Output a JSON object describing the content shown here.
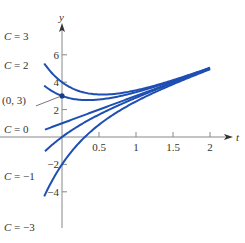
{
  "chart_data": {
    "type": "line",
    "title": "",
    "xlabel": "t",
    "ylabel": "y",
    "formula": "y = 2t + 1 + C e^(-2t)",
    "xlim": [
      -0.35,
      2.25
    ],
    "ylim": [
      -6.5,
      8.2
    ],
    "x_ticks": [
      0.5,
      1,
      1.5,
      2
    ],
    "x_tick_labels": [
      "0.5",
      "1",
      "1.5",
      "2"
    ],
    "y_ticks": [
      -4,
      -2,
      2,
      4,
      6
    ],
    "y_tick_labels": [
      "-4",
      "-2",
      "2",
      "4",
      "6"
    ],
    "grid": false,
    "color": "#1f4fb3",
    "series": [
      {
        "name": "C = 3",
        "C": 3,
        "t_start": -0.24
      },
      {
        "name": "C = 2",
        "C": 2,
        "t_start": -0.24
      },
      {
        "name": "C = 0",
        "C": 0,
        "t_start": -0.23
      },
      {
        "name": "C = -1",
        "C": -1,
        "t_start": -0.23
      },
      {
        "name": "C = -3",
        "C": -3,
        "t_start": -0.24
      }
    ],
    "t_end": 2,
    "annotations": [
      {
        "text": "(0, 3)",
        "x": 0,
        "y": 3
      }
    ],
    "curve_labels": [
      {
        "text": "C = 3",
        "px": 4,
        "py": 40
      },
      {
        "text": "C = 2",
        "px": 4,
        "py": 69
      },
      {
        "text": "(0, 3)",
        "px": 2,
        "py": 104
      },
      {
        "text": "C = 0",
        "px": 4,
        "py": 133
      },
      {
        "text": "C = −1",
        "px": 4,
        "py": 180
      },
      {
        "text": "C = −3",
        "px": 4,
        "py": 231
      }
    ]
  }
}
